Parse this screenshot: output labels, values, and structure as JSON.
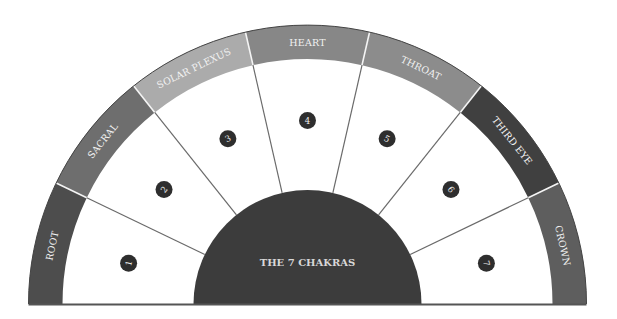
{
  "diagram": {
    "title": "THE 7 CHAKRAS",
    "geometry": {
      "cx": 307.5,
      "cy": 304,
      "outer_r": 279,
      "band_inner_r": 245,
      "center_r": 114
    },
    "divider_color": "#6a6a6a",
    "baseline_color": "#555555",
    "center_color": "#3c3c3c",
    "badge_color": "#2e2e2e",
    "chakras": [
      {
        "number": "1",
        "name": "ROOT",
        "color": "#4d4d4d"
      },
      {
        "number": "2",
        "name": "SACRAL",
        "color": "#6e6e6e"
      },
      {
        "number": "3",
        "name": "SOLAR PLEXUS",
        "color": "#ababab"
      },
      {
        "number": "4",
        "name": "HEART",
        "color": "#878787"
      },
      {
        "number": "5",
        "name": "THROAT",
        "color": "#8c8c8c"
      },
      {
        "number": "6",
        "name": "THIRD EYE",
        "color": "#404040"
      },
      {
        "number": "7",
        "name": "CROWN",
        "color": "#5e5e5e"
      }
    ]
  }
}
